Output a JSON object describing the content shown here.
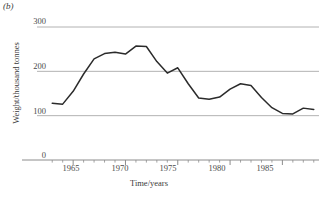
{
  "figure": {
    "panel_label": "(b)",
    "panel_label_name": "panel-label-b"
  },
  "axes": {
    "y_title": "Weight/thousand tonnes",
    "x_title": "Time/years",
    "y_ticks": [
      "0",
      "100",
      "200",
      "300"
    ],
    "x_ticks": [
      "1965",
      "1970",
      "1975",
      "1980",
      "1985"
    ]
  },
  "colors": {
    "line": "#2b2b2b",
    "gridline": "#a9a9a9",
    "axis": "#8c8c8c",
    "text": "#3a3a3a",
    "background": "#ffffff"
  },
  "chart_data": {
    "type": "line",
    "title": "",
    "xlabel": "Time/years",
    "ylabel": "Weight/thousand tonnes",
    "xlim": [
      1962.5,
      1988.5
    ],
    "ylim": [
      0,
      300
    ],
    "grid": true,
    "legend": "none",
    "y_gridlines": [
      100,
      200,
      300
    ],
    "x_major_ticks": [
      1965,
      1970,
      1975,
      1980,
      1985
    ],
    "x_minor_tick_interval": 1,
    "x": [
      1963,
      1964,
      1965,
      1966,
      1967,
      1968,
      1969,
      1970,
      1971,
      1972,
      1973,
      1974,
      1975,
      1976,
      1977,
      1978,
      1979,
      1980,
      1981,
      1982,
      1983,
      1984,
      1985,
      1986,
      1987,
      1988
    ],
    "values": [
      128,
      126,
      155,
      194,
      228,
      240,
      243,
      239,
      257,
      256,
      222,
      196,
      208,
      172,
      140,
      137,
      142,
      160,
      172,
      168,
      141,
      118,
      105,
      104,
      117,
      114
    ],
    "series": [
      {
        "name": "Weight landed",
        "values": [
          128,
          126,
          155,
          194,
          228,
          240,
          243,
          239,
          257,
          256,
          222,
          196,
          208,
          172,
          140,
          137,
          142,
          160,
          172,
          168,
          141,
          118,
          105,
          104,
          117,
          114
        ]
      }
    ]
  }
}
